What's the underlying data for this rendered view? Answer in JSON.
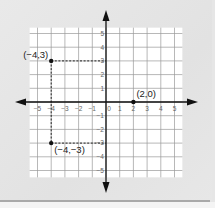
{
  "chart_data": {
    "type": "scatter",
    "title": "",
    "xlabel": "",
    "ylabel": "",
    "xlim": [
      -5.5,
      5.5
    ],
    "ylim": [
      -5.5,
      5.5
    ],
    "grid": true,
    "x_ticks": [
      -5,
      -4,
      -3,
      -2,
      -1,
      0,
      1,
      2,
      3,
      4,
      5
    ],
    "y_ticks": [
      5,
      4,
      3,
      2,
      1,
      -1,
      -2,
      -3,
      -4,
      -5
    ],
    "x_tick_labels": [
      "−5",
      "−4",
      "−3",
      "−2",
      "−1",
      "0",
      "1",
      "2",
      "3",
      "4",
      "5"
    ],
    "y_tick_labels": [
      "5",
      "4",
      "3",
      "2",
      "1",
      "−1",
      "−2",
      "−3",
      "−4",
      "−5"
    ],
    "points": [
      {
        "x": -4,
        "y": 3,
        "label": "(−4,3)"
      },
      {
        "x": 2,
        "y": 0,
        "label": "(2,0)"
      },
      {
        "x": -4,
        "y": -3,
        "label": "(−4,−3)"
      }
    ],
    "guide_lines": [
      {
        "from": [
          -4,
          3
        ],
        "to": [
          0,
          3
        ],
        "style": "dashed"
      },
      {
        "from": [
          -4,
          3
        ],
        "to": [
          -4,
          -3
        ],
        "style": "dashed"
      },
      {
        "from": [
          -4,
          -3
        ],
        "to": [
          0,
          -3
        ],
        "style": "dashed"
      }
    ],
    "axes": {
      "arrows": true,
      "color": "#111111"
    },
    "colors": {
      "grid": "#9a9a9a",
      "plot_bg": "#ffffff",
      "point": "#111111",
      "page_bg": "#e5e5e5"
    }
  }
}
